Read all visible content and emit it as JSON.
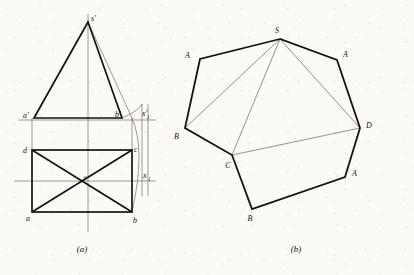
{
  "figure": {
    "background_color": "#fbfaf7",
    "ink_color": "#16130f",
    "thin_color": "#5a5550",
    "captions": {
      "a": "(a)",
      "b": "(b)"
    }
  },
  "projection_view": {
    "name": "orthographic-projection-of-pyramid",
    "labels": {
      "apex_front": "s'",
      "a_front": "a'",
      "b_front": "b'",
      "axis_front": "x'",
      "axis_front_sub": "1",
      "d_top": "d",
      "c_top": "c",
      "a_top": "a",
      "b_top": "b",
      "s_top": "s",
      "axis_top": "x",
      "axis_top_sub": "1"
    },
    "geometry": {
      "apex_front": [
        88,
        22
      ],
      "front_base_left": [
        34,
        118
      ],
      "front_base_right": [
        122,
        118
      ],
      "front_right_edge_inner": [
        132,
        118
      ],
      "top_rect": [
        [
          32,
          150
        ],
        [
          132,
          150
        ],
        [
          132,
          212
        ],
        [
          32,
          212
        ]
      ],
      "top_center": [
        82,
        181
      ],
      "axis_front_y": 120,
      "axis_top_y": 181,
      "axis_x_from": 18,
      "axis_x_to": 156,
      "vertical_centerline_x": 88,
      "aux_vertical_x": 142,
      "aux_vertical_x2": 148
    }
  },
  "development_view": {
    "name": "surface-development-unfolding",
    "labels": {
      "apex": "S",
      "v1": "A",
      "v2": "B",
      "v3": "C",
      "v4": "D",
      "v5": "A",
      "v6": "B"
    },
    "geometry": {
      "apex": [
        280,
        39
      ],
      "outline": [
        [
          280,
          39
        ],
        [
          200,
          59
        ],
        [
          185,
          128
        ],
        [
          232,
          155
        ],
        [
          252,
          209
        ],
        [
          345,
          177
        ],
        [
          360,
          128
        ],
        [
          337,
          60
        ]
      ],
      "points": {
        "S": [
          280,
          39
        ],
        "A_left": [
          200,
          59
        ],
        "B_left": [
          185,
          128
        ],
        "C": [
          232,
          155
        ],
        "B_right": [
          252,
          209
        ],
        "A_right": [
          345,
          177
        ],
        "D": [
          360,
          128
        ],
        "A_top": [
          337,
          60
        ]
      },
      "fold_lines": [
        [
          [
            280,
            39
          ],
          [
            185,
            128
          ]
        ],
        [
          [
            280,
            39
          ],
          [
            232,
            155
          ]
        ],
        [
          [
            280,
            39
          ],
          [
            360,
            128
          ]
        ],
        [
          [
            185,
            128
          ],
          [
            232,
            155
          ]
        ],
        [
          [
            232,
            155
          ],
          [
            360,
            128
          ]
        ],
        [
          [
            360,
            128
          ],
          [
            345,
            177
          ]
        ]
      ]
    }
  }
}
